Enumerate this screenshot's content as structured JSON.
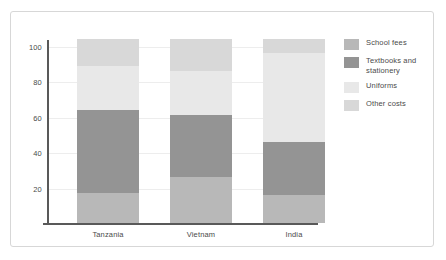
{
  "chart_data": {
    "type": "bar",
    "stacked": true,
    "title": "",
    "subtitle": "",
    "xlabel": "",
    "ylabel": "",
    "categories": [
      "Tanzania",
      "Vietnam",
      "India"
    ],
    "series": [
      {
        "name": "School fees",
        "color": "#b8b8b8",
        "values": [
          17,
          26,
          16
        ]
      },
      {
        "name": "Textbooks and stationery",
        "color": "#949494",
        "values": [
          47,
          35,
          30
        ]
      },
      {
        "name": "Uniforms",
        "color": "#e8e8e8",
        "values": [
          25,
          25,
          50
        ]
      },
      {
        "name": "Other costs",
        "color": "#d8d8d8",
        "values": [
          15,
          18,
          8
        ]
      }
    ],
    "totals": [
      104,
      104,
      104
    ],
    "ylim": [
      0,
      104
    ],
    "yticks": [
      20,
      40,
      60,
      80,
      100
    ],
    "ytick_labels": [
      "20",
      "40",
      "60",
      "80",
      "100"
    ],
    "grid": true,
    "legend": {
      "position": "right",
      "entries": [
        {
          "label": "School fees",
          "swatch_name": "legend-swatch-school-fees",
          "color": "#b8b8b8"
        },
        {
          "label": "Textbooks and stationery",
          "swatch_name": "legend-swatch-textbooks",
          "color": "#949494"
        },
        {
          "label": "Uniforms",
          "swatch_name": "legend-swatch-uniforms",
          "color": "#e8e8e8"
        },
        {
          "label": "Other costs",
          "swatch_name": "legend-swatch-other-costs",
          "color": "#d8d8d8"
        }
      ]
    },
    "axis_color": "#595959",
    "grid_color": "#ededed",
    "text_color": "#4a4a4a",
    "frame_color": "#d7d7d7"
  }
}
